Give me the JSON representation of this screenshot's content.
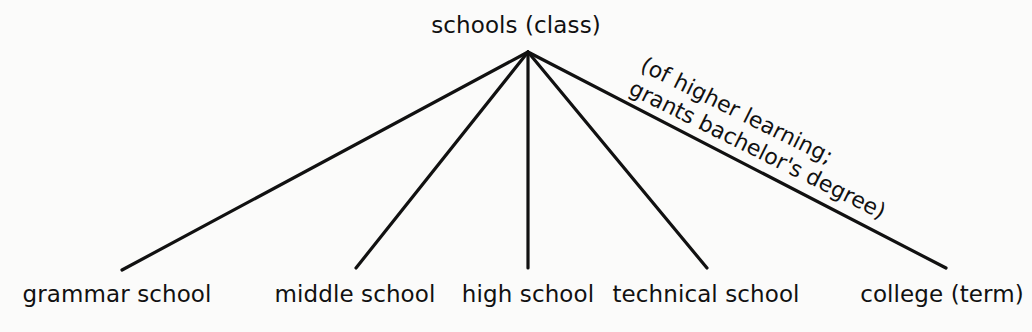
{
  "diagram": {
    "type": "tree",
    "orientation": "top-down-fan",
    "background_color": "#fbfbfa",
    "line_color": "#111111",
    "text_color": "#111111",
    "root": {
      "label": "schools (class)",
      "x": 528,
      "y": 52
    },
    "annotation": {
      "line1": "(of higher learning;",
      "line2": "grants bachelor's degree)",
      "rotation_deg": 26.5,
      "attached_to": "college (term)"
    },
    "leaves": [
      {
        "label": "grammar school",
        "x": 117,
        "edge_end_x": 122,
        "edge_end_y": 270
      },
      {
        "label": "middle school",
        "x": 355,
        "edge_end_x": 356,
        "edge_end_y": 268
      },
      {
        "label": "high school",
        "x": 528,
        "edge_end_x": 528,
        "edge_end_y": 268
      },
      {
        "label": "technical school",
        "x": 706,
        "edge_end_x": 707,
        "edge_end_y": 268
      },
      {
        "label": "college (term)",
        "x": 942,
        "edge_end_x": 946,
        "edge_end_y": 268
      }
    ]
  }
}
